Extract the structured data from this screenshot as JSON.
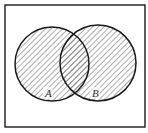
{
  "diagram": {
    "type": "venn",
    "universe": {
      "x": 5,
      "y": 5,
      "width": 140,
      "height": 122
    },
    "sets": [
      {
        "label": "A",
        "cx": 52,
        "cy": 64,
        "r": 37,
        "label_x": 48,
        "label_y": 97
      },
      {
        "label": "B",
        "cx": 98,
        "cy": 63,
        "r": 38,
        "label_x": 95,
        "label_y": 97
      }
    ],
    "shaded_region": "A ∪ B",
    "colors": {
      "stroke": "#1a1a1a",
      "hatch": "#555555",
      "background": "#ffffff"
    }
  }
}
